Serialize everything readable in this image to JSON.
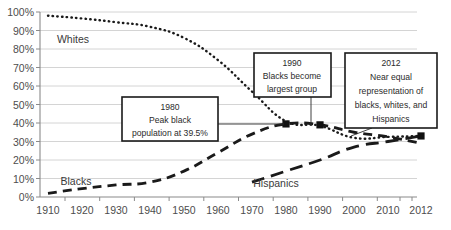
{
  "chart_data": {
    "type": "line",
    "title": "",
    "subtitle": "",
    "xlabel": "",
    "ylabel": "",
    "grid": true,
    "legend_position": "inline-labels",
    "x": [
      1910,
      1920,
      1930,
      1940,
      1950,
      1960,
      1970,
      1980,
      1990,
      2000,
      2010,
      2012
    ],
    "xtick_labels": [
      "1910",
      "1920",
      "1930",
      "1940",
      "1950",
      "1960",
      "1970",
      "1980",
      "1990",
      "2000",
      "2010",
      "2012"
    ],
    "ytick_labels": [
      "0%",
      "10%",
      "20%",
      "30%",
      "40%",
      "50%",
      "60%",
      "70%",
      "80%",
      "90%",
      "100%"
    ],
    "ytick_values": [
      0,
      10,
      20,
      30,
      40,
      50,
      60,
      70,
      80,
      90,
      100
    ],
    "ylim": [
      0,
      100
    ],
    "xlim": [
      1910,
      2012
    ],
    "series": [
      {
        "name": "Whites",
        "style": "dotted",
        "label": "Whites",
        "values": [
          98,
          96.5,
          94.5,
          92,
          86,
          74,
          57,
          41,
          38.5,
          32,
          32.5,
          33
        ]
      },
      {
        "name": "Blacks",
        "style": "dashed",
        "label": "Blacks",
        "values": [
          2,
          4.5,
          6.5,
          8,
          14,
          24,
          34,
          39.5,
          39,
          35,
          32.5,
          29
        ]
      },
      {
        "name": "Hispanics",
        "style": "long-dashed",
        "label": "Hispanics",
        "values": [
          null,
          null,
          null,
          null,
          null,
          null,
          8,
          14,
          20,
          27,
          30,
          33
        ]
      }
    ],
    "markers": [
      {
        "x": 1980,
        "y": 39.5,
        "series": "Blacks"
      },
      {
        "x": 1990,
        "y": 39,
        "series": "Blacks"
      },
      {
        "x": 2012,
        "y": 33,
        "series": "Hispanics"
      }
    ],
    "annotations": [
      {
        "id": "ann-1980",
        "lines": [
          "1980",
          "Peak black",
          "population at 39.5%"
        ],
        "target_x": 1980,
        "target_y": 39.5
      },
      {
        "id": "ann-1990",
        "lines": [
          "1990",
          "Blacks become",
          "largest group"
        ],
        "target_x": 1990,
        "target_y": 39
      },
      {
        "id": "ann-2012",
        "lines": [
          "2012",
          "Near equal",
          "representation of",
          "blacks, whites, and",
          "Hispanics"
        ],
        "target_x": 2012,
        "target_y": 33
      }
    ]
  },
  "axis": {
    "y_labels": [
      "100%",
      "90%",
      "80%",
      "70%",
      "60%",
      "50%",
      "40%",
      "30%",
      "20%",
      "10%",
      "0%"
    ],
    "x_labels": [
      "1910",
      "1920",
      "1930",
      "1940",
      "1950",
      "1960",
      "1970",
      "1980",
      "1990",
      "2000",
      "2010",
      "2012"
    ]
  },
  "labels": {
    "whites": "Whites",
    "blacks": "Blacks",
    "hispanics": "Hispanics"
  },
  "annotation_1980": {
    "line1": "1980",
    "line2": "Peak black",
    "line3": "population at 39.5%"
  },
  "annotation_1990": {
    "line1": "1990",
    "line2": "Blacks become",
    "line3": "largest group"
  },
  "annotation_2012": {
    "line1": "2012",
    "line2": "Near equal",
    "line3": "representation of",
    "line4": "blacks, whites, and",
    "line5": "Hispanics"
  },
  "colors": {
    "line": "#1a1a1a",
    "grid": "#c9c9c9",
    "axis": "#8a8a8a",
    "text": "#3f3f3f",
    "background": "#ffffff"
  }
}
